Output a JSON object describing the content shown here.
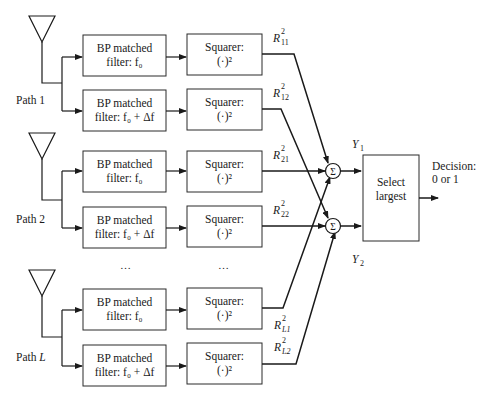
{
  "diagram": {
    "paths": [
      {
        "label": "Path 1",
        "filters": [
          {
            "line1": "BP matched",
            "line2": "filter: f₀"
          },
          {
            "line1": "BP matched",
            "line2": "filter: f₀ + Δf"
          }
        ],
        "squarers": [
          {
            "line1": "Squarer:",
            "line2": "(·)²",
            "output": "R²₁₁",
            "out_base": "R",
            "out_sup": "2",
            "out_sub": "11"
          },
          {
            "line1": "Squarer:",
            "line2": "(·)²",
            "output": "R²₁₂",
            "out_base": "R",
            "out_sup": "2",
            "out_sub": "12"
          }
        ]
      },
      {
        "label": "Path 2",
        "filters": [
          {
            "line1": "BP matched",
            "line2": "filter: f₀"
          },
          {
            "line1": "BP matched",
            "line2": "filter: f₀ + Δf"
          }
        ],
        "squarers": [
          {
            "line1": "Squarer:",
            "line2": "(·)²",
            "out_base": "R",
            "out_sup": "2",
            "out_sub": "21"
          },
          {
            "line1": "Squarer:",
            "line2": "(·)²",
            "out_base": "R",
            "out_sup": "2",
            "out_sub": "22"
          }
        ]
      },
      {
        "label": "Path L",
        "label_prefix": "Path ",
        "label_var": "L",
        "filters": [
          {
            "line1": "BP matched",
            "line2": "filter: f₀"
          },
          {
            "line1": "BP matched",
            "line2": "filter: f₀ + Δf"
          }
        ],
        "squarers": [
          {
            "line1": "Squarer:",
            "line2": "(·)²",
            "out_base": "R",
            "out_sup": "2",
            "out_sub": "L1"
          },
          {
            "line1": "Squarer:",
            "line2": "(·)²",
            "out_base": "R",
            "out_sup": "2",
            "out_sub": "L2"
          }
        ]
      }
    ],
    "ellipsis": "…",
    "summers": [
      {
        "symbol": "Σ",
        "output_base": "Y",
        "output_sub": "1"
      },
      {
        "symbol": "Σ",
        "output_base": "Y",
        "output_sub": "2"
      }
    ],
    "selector": {
      "line1": "Select",
      "line2": "largest"
    },
    "decision": {
      "line1": "Decision:",
      "line2": "0 or 1"
    },
    "icons": {
      "antenna": "antenna-icon",
      "summer": "summation-icon"
    }
  }
}
